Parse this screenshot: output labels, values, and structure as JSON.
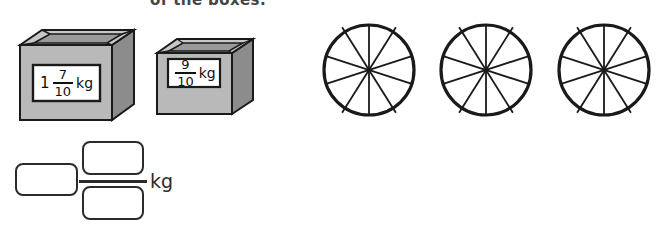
{
  "heading": {
    "text": "of the boxes."
  },
  "boxes": [
    {
      "name": "box-1",
      "label": {
        "whole": "1",
        "numerator": "7",
        "denominator": "10",
        "unit": "kg"
      }
    },
    {
      "name": "box-2",
      "label": {
        "whole": "",
        "numerator": "9",
        "denominator": "10",
        "unit": "kg"
      }
    }
  ],
  "circles": {
    "count": 3,
    "sectors": 10,
    "labels": [
      "circle-1",
      "circle-2",
      "circle-3"
    ]
  },
  "answer": {
    "whole_value": "",
    "whole_placeholder": "",
    "numerator_value": "",
    "numerator_placeholder": "",
    "denominator_value": "",
    "denominator_placeholder": "",
    "unit": "kg"
  },
  "colors": {
    "box_front": "#b9b9b9",
    "box_side": "#8c8c8c",
    "box_top_rim": "#c9c9c9",
    "box_inner": "#9a9a9a",
    "outline": "#1a1a1a",
    "label_bg": "#ffffff",
    "ink": "#2b2b2b"
  }
}
